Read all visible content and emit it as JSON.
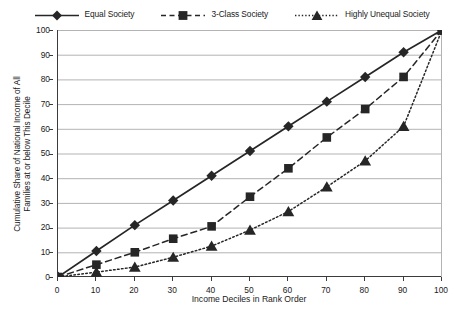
{
  "chart_data": {
    "type": "line",
    "title": "",
    "xlabel": "Income Deciles in Rank Order",
    "ylabel": "Cumulative Share of National Income of All Families at or below This Decile",
    "ylabel_line1": "Cumulative Share of National Income of All",
    "ylabel_line2": "Families at or below This Decile",
    "x": [
      0,
      10,
      20,
      30,
      40,
      50,
      60,
      70,
      80,
      90,
      100
    ],
    "xlim": [
      0,
      100
    ],
    "ylim": [
      0,
      100
    ],
    "xticks": [
      0,
      10,
      20,
      30,
      40,
      50,
      60,
      70,
      80,
      90,
      100
    ],
    "yticks": [
      0,
      10,
      20,
      30,
      40,
      50,
      60,
      70,
      80,
      90,
      100
    ],
    "grid": "horizontal",
    "legend_position": "top-center",
    "series": [
      {
        "name": "Equal Society",
        "marker": "diamond",
        "linestyle": "solid",
        "color": "#262626",
        "values": [
          0,
          10.5,
          21,
          31,
          41,
          51,
          61,
          71,
          81,
          91,
          100
        ]
      },
      {
        "name": "3-Class Society",
        "marker": "square",
        "linestyle": "dashed",
        "color": "#262626",
        "values": [
          0,
          5,
          10,
          15.5,
          20.5,
          32.5,
          44,
          56.5,
          68,
          81,
          100
        ]
      },
      {
        "name": "Highly Unequal Society",
        "marker": "triangle",
        "linestyle": "dotted",
        "color": "#262626",
        "values": [
          0,
          2,
          4,
          8,
          12.5,
          19,
          26.5,
          36.5,
          47,
          61,
          100
        ]
      }
    ]
  },
  "legend": {
    "items": [
      {
        "label": "Equal Society"
      },
      {
        "label": "3-Class Society"
      },
      {
        "label": "Highly Unequal Society"
      }
    ]
  },
  "colors": {
    "ink": "#262626",
    "axis": "#3b3b3b",
    "grid": "#b3b3b3",
    "background": "#ffffff"
  }
}
